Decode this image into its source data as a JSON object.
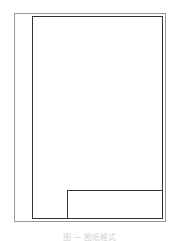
{
  "diagram": {
    "type": "drawing-sheet-frame",
    "elements": [
      "outer-trim-border",
      "inner-drawing-frame",
      "title-block"
    ],
    "colors": {
      "outer_border": "#9a9a9a",
      "inner_border": "#333333"
    }
  },
  "caption": {
    "text": "图 — 图纸格式"
  }
}
